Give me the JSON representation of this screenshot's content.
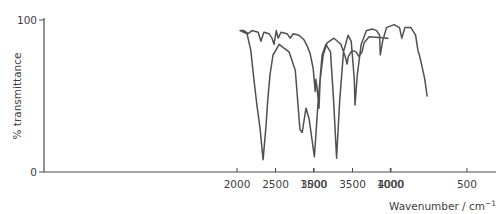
{
  "chart_data": {
    "type": "line",
    "title": "",
    "xlabel": "Wavenumber / cm⁻¹",
    "ylabel": "% transmittance",
    "xlim": [
      4300,
      250
    ],
    "ylim": [
      0,
      100
    ],
    "x_axis_reversed": true,
    "x_axis_scale_note": "scale doubles below 2000 cm-1",
    "grid": false,
    "legend": null,
    "x_ticks": [
      4000,
      3500,
      3000,
      2500,
      2000,
      1500,
      1000,
      500
    ],
    "x_tick_labels": [
      "4000",
      "3500",
      "3000",
      "2500",
      "2000",
      "1500",
      "1000",
      "500"
    ],
    "y_ticks": [
      0,
      100
    ],
    "y_tick_labels": [
      "0",
      "100"
    ],
    "series": [
      {
        "name": "IR spectrum",
        "color": "#505050",
        "x": [
          3960,
          3715,
          3650,
          3625,
          3585,
          3545,
          3495,
          3445,
          3430,
          3405,
          3350,
          3260,
          3170,
          3120,
          3080,
          3065,
          3040,
          3025,
          3015,
          2990,
          2950,
          2910,
          2870,
          2805,
          2730,
          2690,
          2650,
          2570,
          2535,
          2510,
          2480,
          2455,
          2415,
          2350,
          2310,
          2275,
          2195,
          2145,
          2090,
          1980,
          1935,
          1910,
          1890,
          1870,
          1850,
          1830,
          1810,
          1800,
          1785,
          1765,
          1725,
          1700,
          1660,
          1620,
          1590,
          1575,
          1550,
          1530,
          1495,
          1470,
          1445,
          1420,
          1390,
          1370,
          1350,
          1330,
          1305,
          1275,
          1255,
          1235,
          1230,
          1215,
          1190,
          1155,
          1115,
          1090,
          1070,
          1065,
          1050,
          1025,
          975,
          940,
          925,
          905,
          865,
          835,
          820,
          810,
          790,
          775,
          760
        ],
        "y": [
          88,
          89,
          85,
          79,
          76,
          79,
          80,
          76,
          71,
          76,
          84,
          88,
          85,
          77,
          61,
          42,
          55,
          61,
          53,
          68,
          78,
          83,
          87,
          90,
          91,
          88,
          91,
          92,
          88,
          93,
          84,
          88,
          91,
          92,
          86,
          92,
          93,
          91,
          93,
          93,
          91,
          80,
          61,
          44,
          29,
          8,
          31,
          47,
          64,
          77,
          84,
          82,
          79,
          67,
          28,
          26,
          42,
          35,
          10,
          47,
          77,
          84,
          79,
          47,
          9,
          47,
          79,
          90,
          86,
          61,
          44,
          64,
          84,
          93,
          94,
          93,
          90,
          77,
          86,
          95,
          97,
          95,
          88,
          95,
          95,
          90,
          80,
          77,
          68,
          61,
          50
        ]
      }
    ]
  },
  "axes": {
    "y_title": "% transmittance",
    "x_title_main": "Wavenumber / cm",
    "x_title_sup": "−1",
    "y_ticks": [
      {
        "label": "100"
      },
      {
        "label": "0"
      }
    ],
    "x_ticks": [
      {
        "label": "4000"
      },
      {
        "label": "3500"
      },
      {
        "label": "3000"
      },
      {
        "label": "2500"
      },
      {
        "label": "2000"
      },
      {
        "label": "1500"
      },
      {
        "label": "1000"
      },
      {
        "label": "500"
      }
    ]
  }
}
